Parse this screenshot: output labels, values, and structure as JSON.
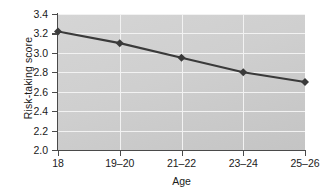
{
  "chart_data": {
    "type": "line",
    "title": "",
    "xlabel": "Age",
    "ylabel": "Risk-taking score",
    "categories": [
      "18",
      "19–20",
      "21–22",
      "23–24",
      "25–26"
    ],
    "values": [
      3.22,
      3.1,
      2.95,
      2.8,
      2.7
    ],
    "series": [
      {
        "name": "Risk-taking score",
        "values": [
          3.22,
          3.1,
          2.95,
          2.8,
          2.7
        ],
        "color": "#3a3a3a",
        "marker": "diamond"
      }
    ],
    "ylim": [
      2.0,
      3.4
    ],
    "yticks": [
      "2.0",
      "2.2",
      "2.4",
      "2.6",
      "2.8",
      "3.0",
      "3.2",
      "3.4"
    ],
    "ytick_values": [
      2.0,
      2.2,
      2.4,
      2.6,
      2.8,
      3.0,
      3.2,
      3.4
    ],
    "xticks": [
      "18",
      "19–20",
      "21–22",
      "23–24",
      "25–26"
    ],
    "grid": true,
    "grid_color": "#f2f2f2",
    "plot_background": "#cfcfcf",
    "legend": false,
    "legend_position": "none",
    "annotations": []
  }
}
